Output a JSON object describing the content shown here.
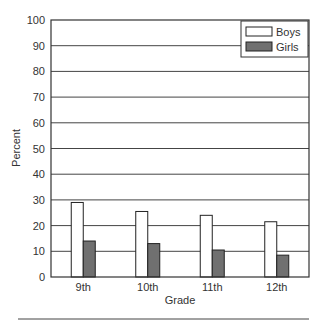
{
  "chart_data": {
    "type": "bar",
    "title": "",
    "xlabel": "Grade",
    "ylabel": "Percent",
    "ylim": [
      0,
      100
    ],
    "yticks": [
      0,
      10,
      20,
      30,
      40,
      50,
      60,
      70,
      80,
      90,
      100
    ],
    "grid": true,
    "legend_position": "upper right",
    "categories": [
      "9th",
      "10th",
      "11th",
      "12th"
    ],
    "series": [
      {
        "name": "Boys",
        "color": "#ffffff",
        "values": [
          29,
          25.5,
          24,
          21.5
        ]
      },
      {
        "name": "Girls",
        "color": "#707070",
        "values": [
          14,
          13,
          10.5,
          8.5
        ]
      }
    ]
  }
}
